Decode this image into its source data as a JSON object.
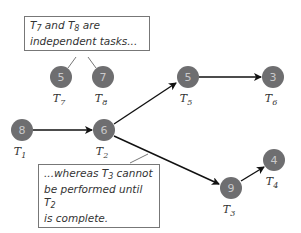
{
  "diagram": {
    "type": "task-dependency-graph",
    "colors": {
      "node_fill": "#6e6e70",
      "node_text": "#c9c9cb",
      "edge": "#111111",
      "callout_border": "#777777"
    },
    "nodes": [
      {
        "id": "T1",
        "label": "T",
        "sub": "1",
        "weight": "8",
        "x": 22,
        "y": 130
      },
      {
        "id": "T2",
        "label": "T",
        "sub": "2",
        "weight": "6",
        "x": 104,
        "y": 130
      },
      {
        "id": "T3",
        "label": "T",
        "sub": "3",
        "weight": "9",
        "x": 231,
        "y": 188
      },
      {
        "id": "T4",
        "label": "T",
        "sub": "4",
        "weight": "4",
        "x": 274,
        "y": 160
      },
      {
        "id": "T5",
        "label": "T",
        "sub": "5",
        "weight": "5",
        "x": 188,
        "y": 77
      },
      {
        "id": "T6",
        "label": "T",
        "sub": "6",
        "weight": "3",
        "x": 273,
        "y": 77
      },
      {
        "id": "T7",
        "label": "T",
        "sub": "7",
        "weight": "5",
        "x": 61,
        "y": 77
      },
      {
        "id": "T8",
        "label": "T",
        "sub": "8",
        "weight": "7",
        "x": 103,
        "y": 77
      }
    ],
    "edges": [
      {
        "from": "T1",
        "to": "T2"
      },
      {
        "from": "T2",
        "to": "T5"
      },
      {
        "from": "T5",
        "to": "T6"
      },
      {
        "from": "T2",
        "to": "T3"
      },
      {
        "from": "T3",
        "to": "T4"
      }
    ],
    "callouts": [
      {
        "id": "independent",
        "parts": [
          "T",
          "7",
          " and T",
          "8",
          " are",
          "independent tasks..."
        ]
      },
      {
        "id": "dependent",
        "parts": [
          "...whereas T",
          "3",
          " cannot",
          "be performed until T",
          "2",
          "is complete."
        ]
      }
    ]
  }
}
